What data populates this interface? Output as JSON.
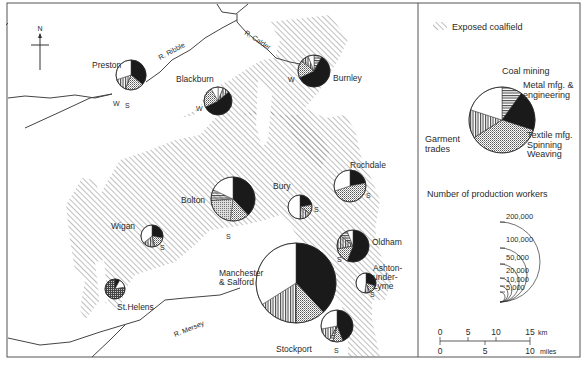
{
  "map": {
    "north_label": "N",
    "rivers": [
      {
        "label": "R. Ribble",
        "x": 160,
        "y": 60,
        "rot": -28
      },
      {
        "label": "R. Calder",
        "x": 244,
        "y": 34,
        "rot": 33
      },
      {
        "label": "R. Mersey",
        "x": 175,
        "y": 337,
        "rot": -22
      }
    ],
    "towns": [
      {
        "name": "Preston",
        "lines": [
          "Preston"
        ],
        "cx": 131,
        "cy": 75,
        "r": 15,
        "lx": 92,
        "ly": 68,
        "anchor": "start",
        "slices": {
          "coal": 0,
          "metal": 36,
          "textile": 20,
          "garment": 14,
          "other": 30
        },
        "marks": [
          {
            "t": "W",
            "x": 113,
            "y": 106
          },
          {
            "t": "S",
            "x": 125,
            "y": 108
          }
        ]
      },
      {
        "name": "Blackburn",
        "lines": [
          "Blackburn"
        ],
        "cx": 218,
        "cy": 101,
        "r": 14,
        "lx": 176,
        "ly": 82,
        "anchor": "start",
        "slices": {
          "coal": 0,
          "metal": 0,
          "textile": 0,
          "garment": 0,
          "other": 0,
          "custom": [
            [
              "other",
              6
            ],
            [
              "stripe_v",
              8
            ],
            [
              "black",
              54
            ],
            [
              "dots",
              24
            ],
            [
              "other",
              8
            ]
          ]
        },
        "marks": [
          {
            "t": "W",
            "x": 196,
            "y": 111
          }
        ]
      },
      {
        "name": "Burnley",
        "lines": [
          "Burnley"
        ],
        "cx": 314,
        "cy": 71,
        "r": 16,
        "lx": 333,
        "ly": 81,
        "anchor": "start",
        "slices": {
          "custom": [
            [
              "stripe_h",
              8
            ],
            [
              "black",
              60
            ],
            [
              "dots",
              18
            ],
            [
              "stripe_v",
              8
            ],
            [
              "other",
              6
            ]
          ]
        },
        "marks": [
          {
            "t": "W",
            "x": 288,
            "y": 82
          }
        ]
      },
      {
        "name": "Rochdale",
        "lines": [
          "Rochdale"
        ],
        "cx": 350,
        "cy": 186,
        "r": 16,
        "lx": 350,
        "ly": 168,
        "anchor": "start",
        "slices": {
          "custom": [
            [
              "black",
              22
            ],
            [
              "dots",
              48
            ],
            [
              "other",
              30
            ]
          ]
        },
        "marks": [
          {
            "t": "S",
            "x": 366,
            "y": 198
          }
        ]
      },
      {
        "name": "Bury",
        "lines": [
          "Bury"
        ],
        "cx": 300,
        "cy": 207,
        "r": 12,
        "lx": 273,
        "ly": 189,
        "anchor": "start",
        "slices": {
          "custom": [
            [
              "black",
              22
            ],
            [
              "dots",
              12
            ],
            [
              "stripe_v",
              16
            ],
            [
              "other",
              50
            ]
          ]
        },
        "marks": [
          {
            "t": "S",
            "x": 314,
            "y": 212
          }
        ]
      },
      {
        "name": "Bolton",
        "lines": [
          "Bolton"
        ],
        "cx": 233,
        "cy": 199,
        "r": 22,
        "lx": 181,
        "ly": 203,
        "anchor": "start",
        "slices": {
          "custom": [
            [
              "black",
              38
            ],
            [
              "dots",
              14
            ],
            [
              "dots2",
              22
            ],
            [
              "stripe_h",
              8
            ],
            [
              "other",
              18
            ]
          ]
        },
        "marks": [
          {
            "t": "S",
            "x": 226,
            "y": 239
          }
        ]
      },
      {
        "name": "Wigan",
        "lines": [
          "Wigan"
        ],
        "cx": 152,
        "cy": 236,
        "r": 11,
        "lx": 111,
        "ly": 229,
        "anchor": "start",
        "slices": {
          "custom": [
            [
              "black",
              28
            ],
            [
              "dots",
              18
            ],
            [
              "stripe_v",
              18
            ],
            [
              "other",
              36
            ]
          ]
        },
        "marks": [
          {
            "t": "S",
            "x": 160,
            "y": 250
          }
        ]
      },
      {
        "name": "Oldham",
        "lines": [
          "Oldham"
        ],
        "cx": 353,
        "cy": 246,
        "r": 16,
        "lx": 372,
        "ly": 245,
        "anchor": "start",
        "slices": {
          "custom": [
            [
              "black",
              56
            ],
            [
              "dots",
              16
            ],
            [
              "stripe_v",
              14
            ],
            [
              "stripe_h",
              8
            ],
            [
              "other",
              6
            ]
          ]
        },
        "marks": [
          {
            "t": "S",
            "x": 337,
            "y": 262
          }
        ]
      },
      {
        "name": "Ashton-under-Lyme",
        "lines": [
          "Ashton-",
          "under-",
          "Lyme"
        ],
        "cx": 366,
        "cy": 283,
        "r": 10,
        "lx": 373,
        "ly": 271,
        "anchor": "start",
        "slices": {
          "custom": [
            [
              "black",
              30
            ],
            [
              "dots",
              14
            ],
            [
              "stripe_v",
              8
            ],
            [
              "other",
              48
            ]
          ]
        },
        "marks": [
          {
            "t": "S",
            "x": 370,
            "y": 297
          }
        ]
      },
      {
        "name": "Manchester & Salford",
        "lines": [
          "Manchester",
          "& Salford"
        ],
        "cx": 296,
        "cy": 283,
        "r": 40,
        "lx": 219,
        "ly": 276,
        "anchor": "start",
        "slices": {
          "custom": [
            [
              "black",
              38
            ],
            [
              "dots",
              12
            ],
            [
              "stripe_v",
              16
            ],
            [
              "other",
              34
            ]
          ]
        },
        "marks": []
      },
      {
        "name": "Stockport",
        "lines": [
          "Stockport"
        ],
        "cx": 337,
        "cy": 326,
        "r": 16,
        "lx": 276,
        "ly": 352,
        "anchor": "start",
        "slices": {
          "custom": [
            [
              "black",
              44
            ],
            [
              "dots",
              10
            ],
            [
              "stripe_h",
              4
            ],
            [
              "stripe_v",
              14
            ],
            [
              "other",
              28
            ]
          ]
        },
        "marks": [
          {
            "t": "S",
            "x": 334,
            "y": 353
          }
        ]
      },
      {
        "name": "St.Helens",
        "lines": [
          "St.Helens"
        ],
        "cx": 115,
        "cy": 289,
        "r": 10,
        "lx": 117,
        "ly": 310,
        "anchor": "start",
        "slices": {
          "custom": [
            [
              "black",
              8
            ],
            [
              "other",
              14
            ],
            [
              "grid",
              78
            ]
          ]
        },
        "marks": []
      }
    ]
  },
  "legend": {
    "coalfield_label": "Exposed coalfield",
    "categories": [
      {
        "key": "coal",
        "lines": [
          "Coal mining"
        ]
      },
      {
        "key": "metal",
        "lines": [
          "Metal mfg. &",
          "engineering"
        ]
      },
      {
        "key": "textile",
        "lines": [
          "Textile mfg.",
          "Spinning",
          "Weaving"
        ]
      },
      {
        "key": "garment",
        "lines": [
          "Garment",
          "trades"
        ]
      }
    ],
    "size_title": "Number of production workers",
    "sizes": [
      "200,000",
      "100,000",
      "50,000",
      "20,000",
      "10,000",
      "5,000"
    ],
    "scale_km": [
      "0",
      "5",
      "10",
      "15"
    ],
    "scale_km_unit": "km",
    "scale_miles": [
      "0",
      "5",
      "10"
    ],
    "scale_miles_unit": "miles"
  },
  "colors": {
    "ink": "#1a1a1a",
    "frame": "#555555",
    "hatch": "#8a8a8a",
    "text": "#2a2a2a"
  }
}
